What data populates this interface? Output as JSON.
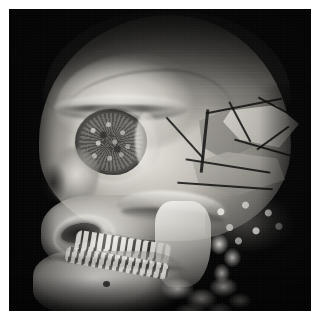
{
  "image": {
    "kind": "medical-3d-volume-rendering",
    "modality": "CT",
    "view": "left anterior oblique lateral",
    "subject": "human skull",
    "colormap": "grayscale",
    "background_color": "#050505",
    "page_margin_color": "#ffffff",
    "bone_highlight_color": "#f0eee9",
    "bone_midtone_color": "#9a9892",
    "shadow_color": "#0c0c0b",
    "caption": ""
  },
  "canvas": {
    "width_px": 302,
    "height_px": 302,
    "offset_x_px": 9,
    "offset_y_px": 9
  },
  "anatomy": {
    "structures": [
      {
        "name": "cranial vault",
        "label": "Calvarium / cranial vault"
      },
      {
        "name": "frontal bone",
        "label": "Frontal bone"
      },
      {
        "name": "supraorbital ridge",
        "label": "Supraorbital ridge"
      },
      {
        "name": "orbit",
        "label": "Right orbit (eye socket)"
      },
      {
        "name": "nasal bones",
        "label": "Nasal bones / bridge"
      },
      {
        "name": "piriform aperture",
        "label": "Piriform (nasal) aperture"
      },
      {
        "name": "maxilla",
        "label": "Maxilla with upper dentition"
      },
      {
        "name": "zygomatic arch",
        "label": "Zygomatic arch"
      },
      {
        "name": "mandibular ramus",
        "label": "Mandibular ramus"
      },
      {
        "name": "mandible body",
        "label": "Mandible body"
      },
      {
        "name": "mental foramen",
        "label": "Mental foramen"
      },
      {
        "name": "mastoid region",
        "label": "Mastoid / skull base"
      },
      {
        "name": "cervical spine",
        "label": "Cervical vertebrae"
      }
    ],
    "findings": [
      {
        "name": "temporoparietal fracture",
        "label": "Comminuted fracture lines, temporoparietal region"
      },
      {
        "name": "bone fragments",
        "label": "Displaced bone fragments"
      }
    ]
  },
  "overlays": {
    "text": [],
    "annotations": []
  }
}
